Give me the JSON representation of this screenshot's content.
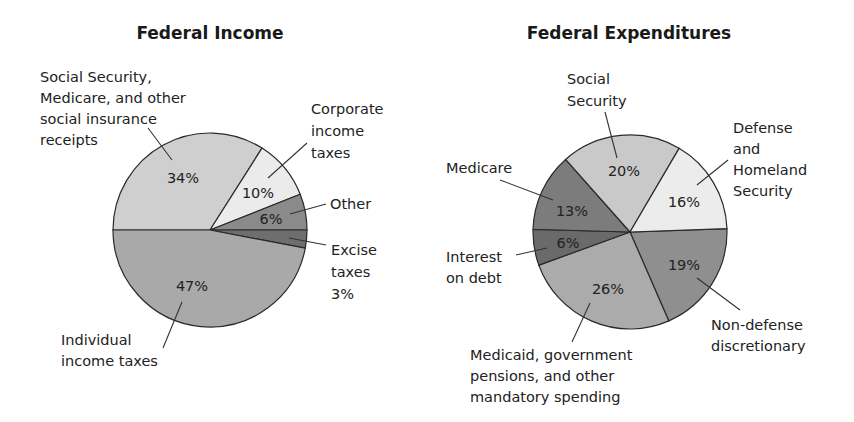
{
  "chart_data": [
    {
      "type": "pie",
      "title": "Federal Income",
      "center": [
        210,
        230
      ],
      "radius": 97,
      "start_angle_deg": -180,
      "slices": [
        {
          "label": "Social Security, Medicare, and other social insurance receipts",
          "value": 34,
          "pct_label": "34%",
          "color": "#cfcfcf"
        },
        {
          "label": "Corporate income taxes",
          "value": 10,
          "pct_label": "10%",
          "color": "#ebebeb"
        },
        {
          "label": "Other",
          "value": 6,
          "pct_label": "6%",
          "color": "#8a8a8a"
        },
        {
          "label": "Excise taxes",
          "value": 3,
          "pct_label": "3%",
          "color": "#6e6e6e"
        },
        {
          "label": "Individual income taxes",
          "value": 47,
          "pct_label": "47%",
          "color": "#a9a9a9"
        }
      ]
    },
    {
      "type": "pie",
      "title": "Federal Expenditures",
      "center": [
        630,
        232
      ],
      "radius": 97,
      "start_angle_deg": -2,
      "slices": [
        {
          "label": "Non-defense discretionary",
          "value": 19,
          "pct_label": "19%",
          "color": "#8f8f8f"
        },
        {
          "label": "Medicaid, government pensions, and other mandatory spending",
          "value": 26,
          "pct_label": "26%",
          "color": "#ababab"
        },
        {
          "label": "Interest on debt",
          "value": 6,
          "pct_label": "6%",
          "color": "#6a6a6a"
        },
        {
          "label": "Medicare",
          "value": 13,
          "pct_label": "13%",
          "color": "#7c7c7c"
        },
        {
          "label": "Social Security",
          "value": 20,
          "pct_label": "20%",
          "color": "#c9c9c9"
        },
        {
          "label": "Defense and Homeland Security",
          "value": 16,
          "pct_label": "16%",
          "color": "#ececec"
        }
      ]
    }
  ],
  "income": {
    "title": "Federal Income",
    "labels": {
      "social_1": "Social Security,",
      "social_2": "Medicare, and other",
      "social_3": "social insurance",
      "social_4": "receipts",
      "corp_1": "Corporate",
      "corp_2": "income",
      "corp_3": "taxes",
      "other": "Other",
      "excise_1": "Excise",
      "excise_2": "taxes",
      "excise_3": "3%",
      "indiv_1": "Individual",
      "indiv_2": "income taxes"
    },
    "pcts": {
      "social": "34%",
      "corp": "10%",
      "other": "6%",
      "indiv": "47%"
    }
  },
  "expenditures": {
    "title": "Federal Expenditures",
    "labels": {
      "ss_1": "Social",
      "ss_2": "Security",
      "def_1": "Defense",
      "def_2": "and",
      "def_3": "Homeland",
      "def_4": "Security",
      "medicare": "Medicare",
      "int_1": "Interest",
      "int_2": "on debt",
      "nd_1": "Non-defense",
      "nd_2": "discretionary",
      "med_1": "Medicaid, government",
      "med_2": "pensions, and other",
      "med_3": "mandatory spending"
    },
    "pcts": {
      "ss": "20%",
      "def": "16%",
      "medicare": "13%",
      "int": "6%",
      "nd": "19%",
      "med": "26%"
    }
  }
}
